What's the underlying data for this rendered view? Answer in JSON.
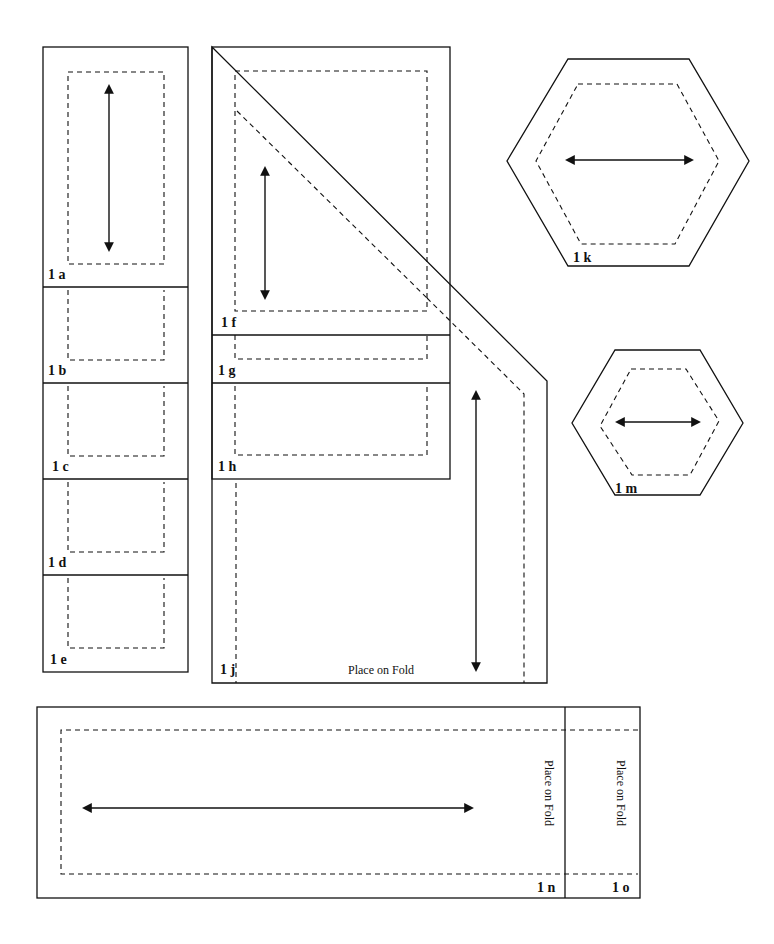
{
  "diagram": {
    "type": "sewing-pattern-pieces",
    "pieces": [
      {
        "id": "1a",
        "label": "1 a",
        "grainline": "vertical"
      },
      {
        "id": "1b",
        "label": "1 b"
      },
      {
        "id": "1c",
        "label": "1 c"
      },
      {
        "id": "1d",
        "label": "1 d"
      },
      {
        "id": "1e",
        "label": "1 e"
      },
      {
        "id": "1f",
        "label": "1 f",
        "grainline": "vertical"
      },
      {
        "id": "1g",
        "label": "1 g"
      },
      {
        "id": "1h",
        "label": "1 h"
      },
      {
        "id": "1j",
        "label": "1 j",
        "grainline": "vertical",
        "fold_text": "Place on Fold"
      },
      {
        "id": "1k",
        "label": "1 k",
        "shape": "hexagon",
        "grainline": "horizontal"
      },
      {
        "id": "1m",
        "label": "1 m",
        "shape": "hexagon",
        "grainline": "horizontal"
      },
      {
        "id": "1n",
        "label": "1 n",
        "grainline": "horizontal",
        "fold_text": "Place on Fold"
      },
      {
        "id": "1o",
        "label": "1 o",
        "fold_text": "Place on Fold"
      }
    ],
    "legend": {
      "solid_line": "cutting line",
      "dashed_line": "seam line",
      "double_arrow": "grainline"
    }
  }
}
